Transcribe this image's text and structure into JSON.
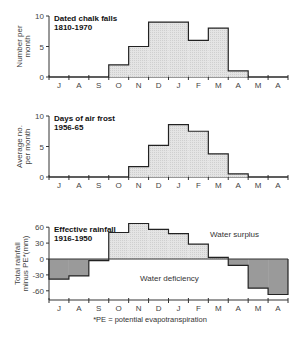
{
  "chart_data": [
    {
      "type": "bar",
      "title": "Dated chalk falls",
      "subtitle": "1810-1970",
      "xlabel": "",
      "ylabel": "Number per month",
      "ylim": [
        0,
        10
      ],
      "yticks": [
        0,
        5,
        10
      ],
      "categories": [
        "J",
        "A",
        "S",
        "O",
        "N",
        "D",
        "J",
        "F",
        "M",
        "A",
        "M",
        "A"
      ],
      "values": [
        0,
        0,
        0,
        2,
        5,
        9,
        9,
        6,
        8,
        1,
        0,
        0
      ]
    },
    {
      "type": "bar",
      "title": "Days of air frost",
      "subtitle": "1956-65",
      "xlabel": "",
      "ylabel": "Average no. per month",
      "ylim": [
        0,
        10
      ],
      "yticks": [
        0,
        5,
        10
      ],
      "categories": [
        "J",
        "A",
        "S",
        "O",
        "N",
        "D",
        "J",
        "F",
        "M",
        "A",
        "M",
        "A"
      ],
      "values": [
        0,
        0,
        0,
        0,
        1.7,
        5.2,
        8.6,
        7.5,
        3.8,
        0.5,
        0,
        0
      ]
    },
    {
      "type": "bar",
      "title": "Effective rainfall",
      "subtitle": "1916-1950",
      "xlabel": "",
      "ylabel": "Total rainfall minus PE* (mm)",
      "ylim": [
        -70,
        70
      ],
      "yticks": [
        -60,
        -30,
        0,
        30,
        60
      ],
      "categories": [
        "J",
        "A",
        "S",
        "O",
        "N",
        "D",
        "J",
        "F",
        "M",
        "A",
        "M",
        "A"
      ],
      "values": [
        -38,
        -32,
        -3,
        50,
        67,
        56,
        48,
        28,
        3,
        -12,
        -55,
        -67
      ],
      "annotations": [
        "Water surplus",
        "Water deficiency"
      ],
      "footnote": "*PE = potential evapotranspiration"
    }
  ],
  "labels": {
    "c1_title": "Dated chalk falls",
    "c1_sub": "1810-1970",
    "c1_y1": "Number per",
    "c1_y2": "month",
    "c2_title": "Days of air frost",
    "c2_sub": "1956-65",
    "c2_y1": "Average no.",
    "c2_y2": "per month",
    "c3_title": "Effective rainfall",
    "c3_sub": "1916-1950",
    "c3_y1": "Total rainfall",
    "c3_y2": "minus PE*(mm)",
    "surplus": "Water surplus",
    "deficiency": "Water deficiency",
    "footnote": "*PE = potential evapotranspiration"
  }
}
